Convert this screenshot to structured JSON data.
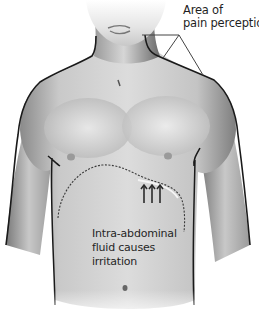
{
  "figure": {
    "colors": {
      "background": "#ffffff",
      "skin_light": "#e6e6e6",
      "skin_mid": "#b8b8b8",
      "skin_dark": "#6e6e6e",
      "outline": "#1a1a1a",
      "pointer_line": "#444444",
      "dashed_region": "#3a3a3a",
      "text": "#1f1f1f"
    }
  },
  "labels": {
    "pain_perception": {
      "line1": "Area of",
      "line2": "pain perception"
    },
    "fluid_irritation": {
      "line1": "Intra-abdominal",
      "line2": "fluid causes",
      "line3": "irritation"
    }
  },
  "markers": {
    "arrows": {
      "count": 3,
      "direction": "up",
      "icon": "arrow-up-icon"
    }
  }
}
